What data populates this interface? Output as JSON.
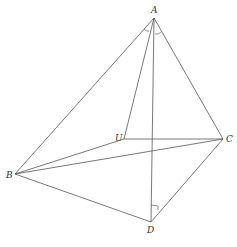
{
  "diagram": {
    "type": "tetrahedron",
    "vertices": [
      {
        "id": "A",
        "label": "A",
        "x": 154,
        "y": 18,
        "lx": 151,
        "ly": 13
      },
      {
        "id": "U",
        "label": "U",
        "x": 124,
        "y": 139,
        "lx": 115,
        "ly": 141
      },
      {
        "id": "C",
        "label": "C",
        "x": 223,
        "y": 139,
        "lx": 226,
        "ly": 142
      },
      {
        "id": "B",
        "label": "B",
        "x": 15,
        "y": 174,
        "lx": 6,
        "ly": 178
      },
      {
        "id": "D",
        "label": "D",
        "x": 151,
        "y": 222,
        "lx": 147,
        "ly": 233
      }
    ],
    "edges": [
      [
        "A",
        "B"
      ],
      [
        "A",
        "U"
      ],
      [
        "A",
        "C"
      ],
      [
        "A",
        "D"
      ],
      [
        "U",
        "C"
      ],
      [
        "U",
        "B"
      ],
      [
        "B",
        "C"
      ],
      [
        "B",
        "D"
      ],
      [
        "C",
        "D"
      ]
    ],
    "line_color": "#555555",
    "annotations": [
      {
        "type": "angle-arc",
        "at": "A",
        "between": [
          "B",
          "U"
        ]
      },
      {
        "type": "angle-arc",
        "at": "A",
        "between": [
          "D",
          "C"
        ]
      },
      {
        "type": "right-angle",
        "at": "D",
        "on": [
          "A",
          "D"
        ]
      }
    ]
  }
}
